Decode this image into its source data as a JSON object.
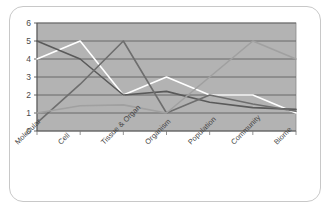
{
  "chart_data": {
    "type": "line",
    "title": "",
    "xlabel": "",
    "ylabel": "",
    "categories": [
      "Molecular",
      "Cell",
      "Tissue & Organ",
      "Organism",
      "Population",
      "Community",
      "Biome"
    ],
    "ylim": [
      0,
      6
    ],
    "yticks": [
      0,
      1,
      2,
      3,
      4,
      5,
      6
    ],
    "grid": true,
    "legend": "none",
    "plot_background": "#b3b3b3",
    "series": [
      {
        "name": "series-white",
        "color": "#ffffff",
        "values": [
          4,
          5,
          2,
          3,
          2,
          2,
          1
        ]
      },
      {
        "name": "series-dark",
        "color": "#5a5a5a",
        "values": [
          5,
          4,
          2,
          2.2,
          1.6,
          1.3,
          1.2
        ]
      },
      {
        "name": "series-mid",
        "color": "#6e6e6e",
        "values": [
          0.45,
          2.6,
          5,
          1,
          2,
          1.5,
          1.1
        ]
      },
      {
        "name": "series-light",
        "color": "#a0a0a0",
        "values": [
          1,
          1.4,
          1.45,
          1,
          3,
          5,
          4
        ]
      }
    ]
  }
}
